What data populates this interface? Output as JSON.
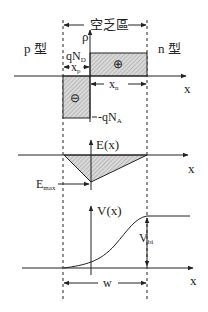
{
  "title": "空乏區",
  "regions": {
    "p": "p 型",
    "n": "n 型"
  },
  "charge_panel": {
    "axis_y": "ρ",
    "axis_x": "x",
    "positive_level": "qN",
    "positive_sub": "D",
    "negative_level": "-qN",
    "negative_sub": "A",
    "xp": "x",
    "xp_sub": "p",
    "xn": "x",
    "xn_sub": "n",
    "plus_symbol": "⊕",
    "minus_symbol": "⊖"
  },
  "field_panel": {
    "axis_y": "E(x)",
    "axis_x": "x",
    "emax": "E",
    "emax_sub": "max"
  },
  "potential_panel": {
    "axis_y": "V(x)",
    "axis_x": "x",
    "vbi": "V",
    "vbi_sub": "bi",
    "width": "w"
  },
  "colors": {
    "ink": "#222222",
    "hatch": "#bdbdbd",
    "fill": "#d6d6d6"
  }
}
